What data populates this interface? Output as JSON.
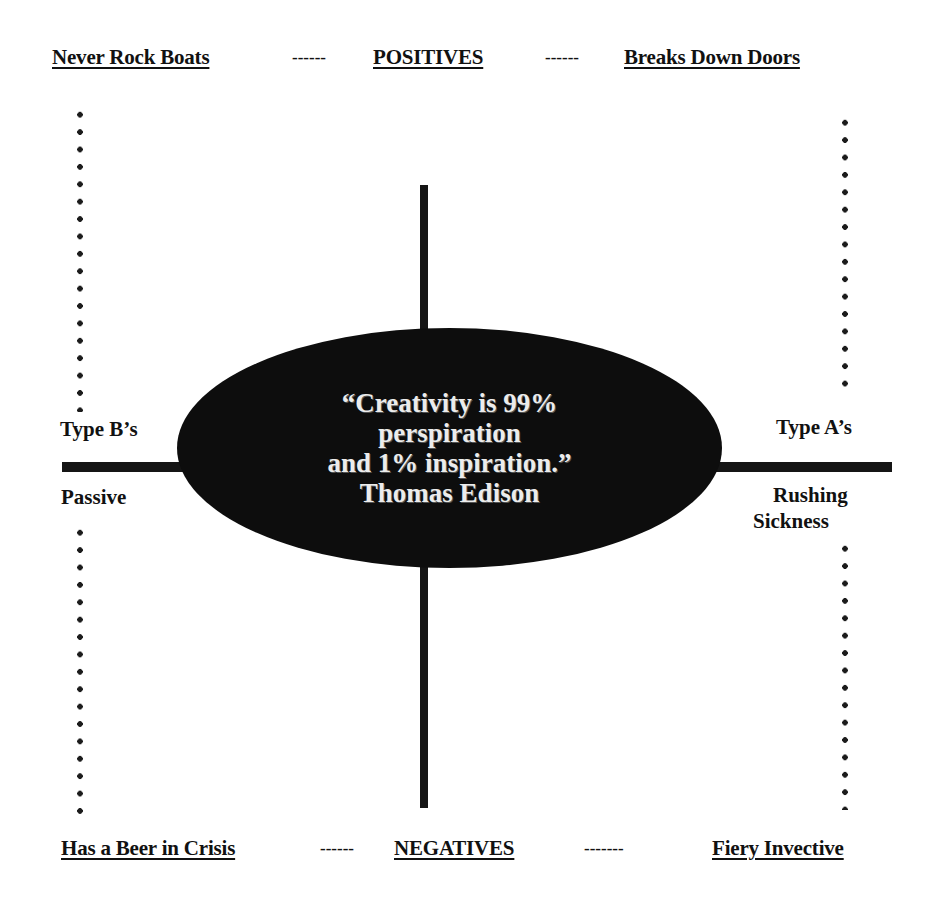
{
  "top_row": {
    "left": "Never Rock Boats",
    "separator_left": "------",
    "center": "POSITIVES",
    "separator_right": "------",
    "right": "Breaks Down Doors"
  },
  "bottom_row": {
    "left": "Has a Beer in Crisis",
    "separator_left": "------",
    "center": "NEGATIVES",
    "separator_right": "-------",
    "right": "Fiery Invective"
  },
  "left_axis": {
    "top_label": "Type B’s",
    "bottom_label": "Passive"
  },
  "right_axis": {
    "top_label": "Type A’s",
    "bottom_label_line1": "Rushing",
    "bottom_label_line2": "Sickness"
  },
  "center_quote": {
    "line1": "“Creativity is 99%",
    "line2": "perspiration",
    "line3": "and 1% inspiration.”",
    "attribution": "Thomas Edison"
  },
  "colors": {
    "background": "#ffffff",
    "ink": "#111111",
    "oval_fill": "#0d0d0d",
    "quote_text": "#ececec"
  }
}
